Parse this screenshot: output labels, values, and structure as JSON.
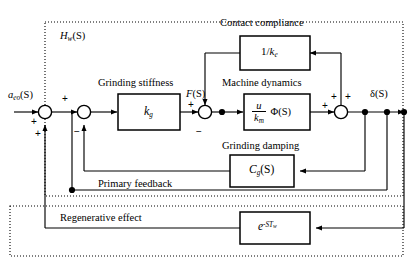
{
  "figure": {
    "type": "control-block-diagram",
    "title_inner": "H",
    "outer_region_label": {
      "base": "H",
      "sub": "w",
      "arg": "(S)"
    }
  },
  "signals": {
    "input": {
      "base": "a",
      "sub": "eo",
      "arg": "(S)"
    },
    "force": {
      "base": "F",
      "arg": "(S)"
    },
    "output": {
      "base": "δ",
      "arg": "(S)"
    }
  },
  "sections": {
    "contact_compliance": "Contact compliance",
    "grinding_stiffness": "Grinding stiffness",
    "machine_dynamics": "Machine dynamics",
    "grinding_damping": "Grinding damping",
    "primary_feedback": "Primary feedback",
    "regenerative_effect": "Regenerative effect"
  },
  "blocks": [
    {
      "id": "contact-compliance",
      "numerator": "1/k",
      "sub": "e",
      "text": "1/k_e"
    },
    {
      "id": "grinding-stiffness",
      "base": "k",
      "sub": "g",
      "text": "k_g"
    },
    {
      "id": "machine-dynamics",
      "num": "u",
      "den": "k",
      "den_sub": "m",
      "tail": "Φ(S)",
      "text": "(u/k_m)Φ(S)"
    },
    {
      "id": "grinding-damping",
      "base": "C",
      "sub": "g",
      "arg": "(S)",
      "text": "C_g(S)"
    },
    {
      "id": "regenerative-delay",
      "base": "e",
      "sup": "-ST",
      "sup_sub": "w",
      "text": "e^{-ST_w}"
    }
  ],
  "summing_junctions": [
    {
      "id": "sum-1",
      "signs": [
        "+",
        "+"
      ]
    },
    {
      "id": "sum-2",
      "signs": [
        "+",
        "−"
      ]
    },
    {
      "id": "sum-3",
      "signs": [
        "+",
        "−"
      ]
    },
    {
      "id": "sum-4",
      "signs": [
        "+",
        "+",
        "+"
      ]
    }
  ],
  "signs": {
    "plus": "+",
    "minus": "−"
  },
  "colors": {
    "line": "#000000",
    "background": "#ffffff",
    "dotted_boundary": "#000000"
  }
}
